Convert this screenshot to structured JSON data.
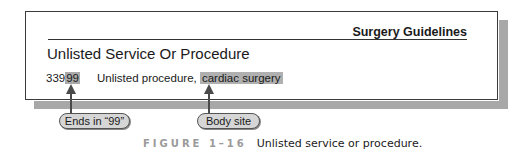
{
  "panel": {
    "header_title": "Surgery Guidelines",
    "section_title": "Unlisted Service Or Procedure",
    "entry": {
      "code_prefix": "339",
      "code_suffix_highlighted": "99",
      "description_prefix": "Unlisted procedure, ",
      "description_highlighted": "cardiac surgery"
    }
  },
  "callouts": [
    {
      "label": "Ends in “99”",
      "points_to": "code_suffix_highlighted"
    },
    {
      "label": "Body site",
      "points_to": "description_highlighted"
    }
  ],
  "caption": {
    "figure_label": "FIGURE 1–16",
    "text": "Unlisted service or procedure."
  },
  "colors": {
    "highlight": "#a9a9a9",
    "shadow": "#a8a8a8",
    "pill_fill": "#d6d6d6",
    "arrow": "#4a4a4a",
    "figure_label": "#9a9a9a"
  }
}
